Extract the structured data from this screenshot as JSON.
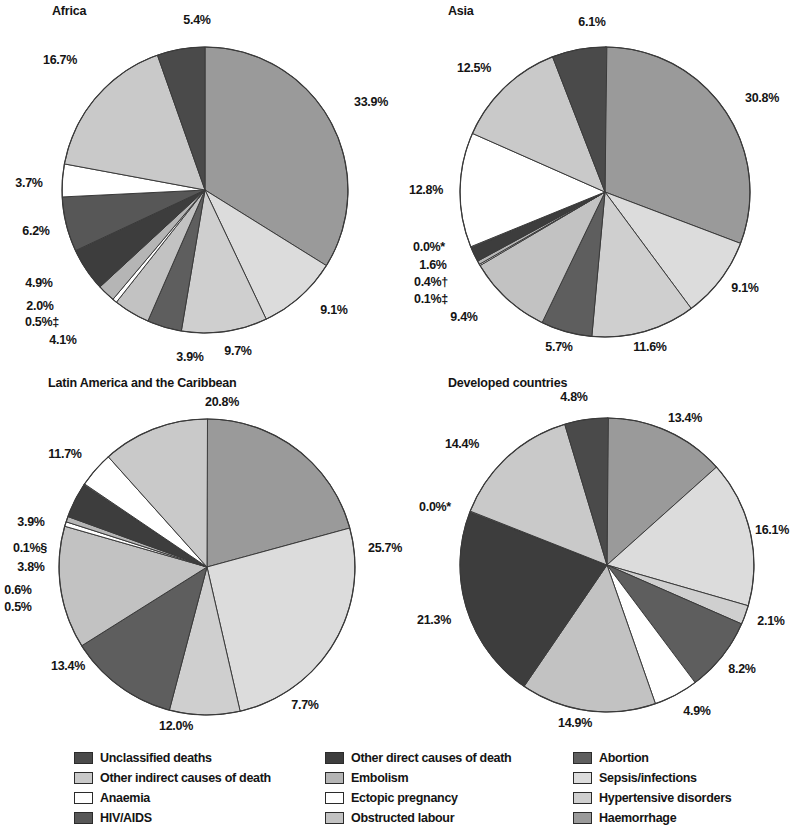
{
  "figure": {
    "background": "#ffffff",
    "text_color": "#141414"
  },
  "categories": [
    {
      "key": "unclassified",
      "label": "Unclassified deaths",
      "color": "#4a4a4a"
    },
    {
      "key": "other_indirect",
      "label": "Other indirect causes of death",
      "color": "#c9c9c9"
    },
    {
      "key": "anaemia",
      "label": "Anaemia",
      "color": "#ffffff"
    },
    {
      "key": "hiv_aids",
      "label": "HIV/AIDS",
      "color": "#575757"
    },
    {
      "key": "other_direct",
      "label": "Other direct causes of death",
      "color": "#3d3d3d"
    },
    {
      "key": "embolism",
      "label": "Embolism",
      "color": "#b5b5b5"
    },
    {
      "key": "ectopic",
      "label": "Ectopic pregnancy",
      "color": "#ffffff"
    },
    {
      "key": "obstructed",
      "label": "Obstructed labour",
      "color": "#c2c2c2"
    },
    {
      "key": "abortion",
      "label": "Abortion",
      "color": "#5e5e5e"
    },
    {
      "key": "sepsis",
      "label": "Sepsis/infections",
      "color": "#dcdcdc"
    },
    {
      "key": "hypertensive",
      "label": "Hypertensive disorders",
      "color": "#cfcfcf"
    },
    {
      "key": "haemorrhage",
      "label": "Haemorrhage",
      "color": "#9a9a9a"
    }
  ],
  "legend": {
    "columns": [
      {
        "items": [
          {
            "label": "Unclassified deaths",
            "color": "#4a4a4a"
          },
          {
            "label": "Other indirect causes of death",
            "color": "#c9c9c9"
          },
          {
            "label": "Anaemia",
            "color": "#ffffff"
          },
          {
            "label": "HIV/AIDS",
            "color": "#575757"
          }
        ]
      },
      {
        "items": [
          {
            "label": "Other direct causes of death",
            "color": "#3d3d3d"
          },
          {
            "label": "Embolism",
            "color": "#b5b5b5"
          },
          {
            "label": "Ectopic pregnancy",
            "color": "#ffffff"
          },
          {
            "label": "Obstructed labour",
            "color": "#c2c2c2"
          }
        ]
      },
      {
        "items": [
          {
            "label": "Abortion",
            "color": "#5e5e5e"
          },
          {
            "label": "Sepsis/infections",
            "color": "#dcdcdc"
          },
          {
            "label": "Hypertensive disorders",
            "color": "#cfcfcf"
          },
          {
            "label": "Haemorrhage",
            "color": "#9a9a9a"
          }
        ]
      }
    ]
  },
  "chart_data": [
    {
      "type": "pie",
      "id": "africa",
      "title": "Africa",
      "center": [
        205,
        190
      ],
      "radius": 143,
      "start_angle": -90,
      "slices": [
        {
          "category": "haemorrhage",
          "label": "33.9%",
          "value": 33.9,
          "color": "#9a9a9a",
          "label_pos": [
            371,
            102
          ]
        },
        {
          "category": "sepsis",
          "label": "9.1%",
          "value": 9.1,
          "color": "#dcdcdc",
          "label_pos": [
            334,
            310
          ]
        },
        {
          "category": "hypertensive",
          "label": "9.7%",
          "value": 9.7,
          "color": "#cfcfcf",
          "label_pos": [
            238,
            351
          ]
        },
        {
          "category": "abortion",
          "label": "3.9%",
          "value": 3.9,
          "color": "#5e5e5e",
          "label_pos": [
            190,
            357
          ]
        },
        {
          "category": "obstructed",
          "label": "4.1%",
          "value": 4.1,
          "color": "#c2c2c2",
          "label_pos": [
            63,
            340
          ]
        },
        {
          "category": "ectopic",
          "label": "0.5%‡",
          "value": 0.5,
          "color": "#ffffff",
          "label_pos": [
            42,
            322
          ]
        },
        {
          "category": "embolism",
          "label": "2.0%",
          "value": 2.0,
          "color": "#b5b5b5",
          "label_pos": [
            40,
            306
          ]
        },
        {
          "category": "other_direct",
          "label": "4.9%",
          "value": 4.9,
          "color": "#3d3d3d",
          "label_pos": [
            39,
            283
          ]
        },
        {
          "category": "hiv_aids",
          "label": "6.2%",
          "value": 6.2,
          "color": "#575757",
          "label_pos": [
            36,
            231
          ]
        },
        {
          "category": "anaemia",
          "label": "3.7%",
          "value": 3.7,
          "color": "#ffffff",
          "label_pos": [
            29,
            183
          ]
        },
        {
          "category": "other_indirect",
          "label": "16.7%",
          "value": 16.7,
          "color": "#c9c9c9",
          "label_pos": [
            60,
            60
          ]
        },
        {
          "category": "unclassified",
          "label": "5.4%",
          "value": 5.4,
          "color": "#4a4a4a",
          "label_pos": [
            197,
            20
          ]
        }
      ]
    },
    {
      "type": "pie",
      "id": "asia",
      "title": "Asia",
      "center": [
        203,
        192
      ],
      "radius": 145,
      "start_angle": -90,
      "slices": [
        {
          "category": "haemorrhage",
          "label": "30.8%",
          "value": 30.8,
          "color": "#9a9a9a",
          "label_pos": [
            360,
            98
          ]
        },
        {
          "category": "sepsis",
          "label": "9.1%",
          "value": 9.1,
          "color": "#dcdcdc",
          "label_pos": [
            343,
            288
          ]
        },
        {
          "category": "hypertensive",
          "label": "11.6%",
          "value": 11.6,
          "color": "#cfcfcf",
          "label_pos": [
            248,
            347
          ]
        },
        {
          "category": "abortion",
          "label": "5.7%",
          "value": 5.7,
          "color": "#5e5e5e",
          "label_pos": [
            157,
            347
          ]
        },
        {
          "category": "obstructed",
          "label": "9.4%",
          "value": 9.4,
          "color": "#c2c2c2",
          "label_pos": [
            62,
            317
          ]
        },
        {
          "category": "ectopic",
          "label": "0.1%‡",
          "value": 0.1,
          "color": "#ffffff",
          "label_pos": [
            29,
            299
          ]
        },
        {
          "category": "embolism",
          "label": "0.4%†",
          "value": 0.4,
          "color": "#b5b5b5",
          "label_pos": [
            29,
            282
          ]
        },
        {
          "category": "other_direct",
          "label": "1.6%",
          "value": 1.6,
          "color": "#3d3d3d",
          "label_pos": [
            31,
            265
          ]
        },
        {
          "category": "hiv_aids",
          "label": "0.0%*",
          "value": 0.0,
          "color": "#575757",
          "label_pos": [
            27,
            247
          ]
        },
        {
          "category": "anaemia",
          "label": "12.8%",
          "value": 12.8,
          "color": "#ffffff",
          "label_pos": [
            24,
            190
          ]
        },
        {
          "category": "other_indirect",
          "label": "12.5%",
          "value": 12.5,
          "color": "#c9c9c9",
          "label_pos": [
            72,
            68
          ]
        },
        {
          "category": "unclassified",
          "label": "6.1%",
          "value": 6.1,
          "color": "#4a4a4a",
          "label_pos": [
            190,
            22
          ]
        }
      ]
    },
    {
      "type": "pie",
      "id": "latin_america",
      "title": "Latin America and the Caribbean",
      "center": [
        207,
        195
      ],
      "radius": 148,
      "start_angle": -90,
      "slices": [
        {
          "category": "haemorrhage",
          "label": "20.8%",
          "value": 20.8,
          "color": "#9a9a9a",
          "label_pos": [
            222,
            30
          ]
        },
        {
          "category": "sepsis",
          "label": "25.7%",
          "value": 25.7,
          "color": "#dcdcdc",
          "label_pos": [
            385,
            176
          ]
        },
        {
          "category": "hypertensive",
          "label": "7.7%",
          "value": 7.7,
          "color": "#cfcfcf",
          "label_pos": [
            305,
            333
          ]
        },
        {
          "category": "abortion",
          "label": "12.0%",
          "value": 12.0,
          "color": "#5e5e5e",
          "label_pos": [
            176,
            354
          ]
        },
        {
          "category": "obstructed",
          "label": "13.4%",
          "value": 13.4,
          "color": "#c2c2c2",
          "label_pos": [
            68,
            294
          ]
        },
        {
          "category": "ectopic",
          "label": "0.5%",
          "value": 0.5,
          "color": "#ffffff",
          "label_pos": [
            18,
            235
          ]
        },
        {
          "category": "embolism",
          "label": "0.6%",
          "value": 0.6,
          "color": "#b5b5b5",
          "label_pos": [
            18,
            218
          ]
        },
        {
          "category": "other_direct",
          "label": "3.8%",
          "value": 3.8,
          "color": "#3d3d3d",
          "label_pos": [
            31,
            195
          ]
        },
        {
          "category": "hiv_aids",
          "label": "0.1%§",
          "value": 0.1,
          "color": "#575757",
          "label_pos": [
            30,
            176
          ]
        },
        {
          "category": "anaemia",
          "label": "3.9%",
          "value": 3.9,
          "color": "#ffffff",
          "label_pos": [
            31,
            150
          ]
        },
        {
          "category": "other_indirect",
          "label": "11.7%",
          "value": 11.7,
          "color": "#c9c9c9",
          "label_pos": [
            65,
            82
          ]
        }
      ]
    },
    {
      "type": "pie",
      "id": "developed",
      "title": "Developed countries",
      "center": [
        205,
        193
      ],
      "radius": 147,
      "start_angle": -90,
      "slices": [
        {
          "category": "haemorrhage",
          "label": "13.4%",
          "value": 13.4,
          "color": "#9a9a9a",
          "label_pos": [
            283,
            46
          ]
        },
        {
          "category": "sepsis",
          "label": "16.1%",
          "value": 16.1,
          "color": "#dcdcdc",
          "label_pos": [
            370,
            158
          ]
        },
        {
          "category": "hypertensive",
          "label": "2.1%",
          "value": 2.1,
          "color": "#cfcfcf",
          "label_pos": [
            369,
            249
          ]
        },
        {
          "category": "abortion",
          "label": "8.2%",
          "value": 8.2,
          "color": "#5e5e5e",
          "label_pos": [
            340,
            297
          ]
        },
        {
          "category": "ectopic",
          "label": "4.9%",
          "value": 4.9,
          "color": "#ffffff",
          "label_pos": [
            295,
            339
          ]
        },
        {
          "category": "obstructed",
          "label": "14.9%",
          "value": 14.9,
          "color": "#c2c2c2",
          "label_pos": [
            173,
            351
          ]
        },
        {
          "category": "other_direct",
          "label": "21.3%",
          "value": 21.3,
          "color": "#3d3d3d",
          "label_pos": [
            32,
            248
          ]
        },
        {
          "category": "hiv_aids",
          "label": "0.0%*",
          "value": 0.0,
          "color": "#575757",
          "label_pos": [
            33,
            135
          ]
        },
        {
          "category": "other_indirect",
          "label": "14.4%",
          "value": 14.4,
          "color": "#c9c9c9",
          "label_pos": [
            60,
            72
          ]
        },
        {
          "category": "unclassified",
          "label": "4.8%",
          "value": 4.8,
          "color": "#4a4a4a",
          "label_pos": [
            172,
            25
          ]
        }
      ]
    }
  ]
}
